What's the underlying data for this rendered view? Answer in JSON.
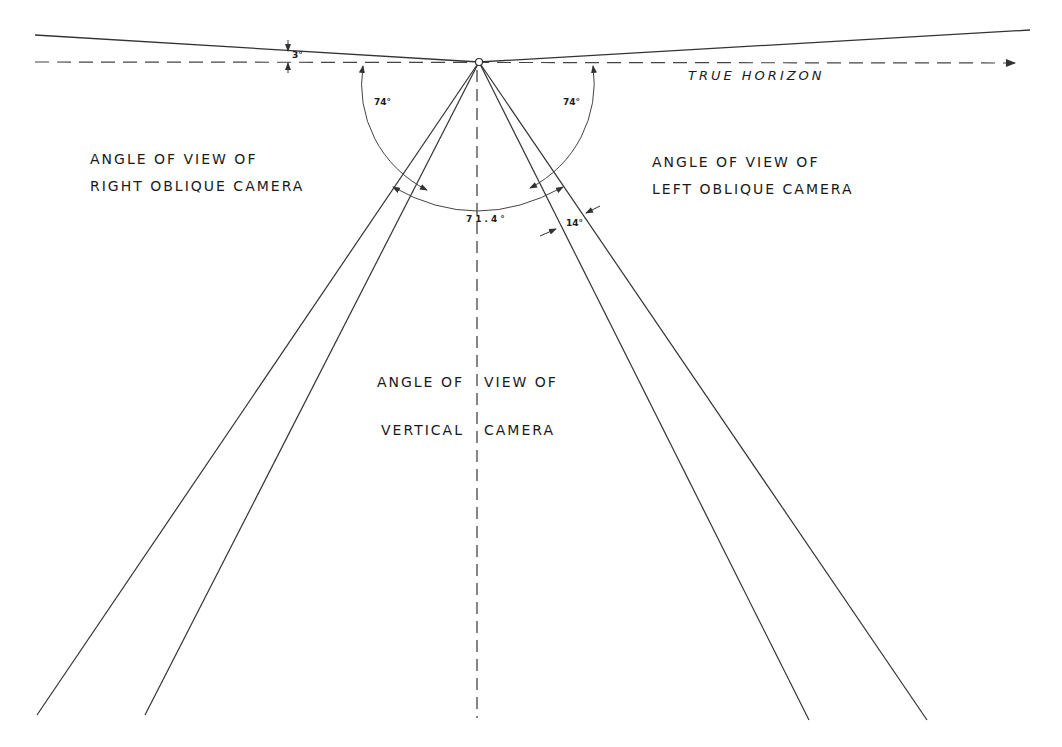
{
  "diagram": {
    "horizon_label": "TRUE HORIZON",
    "labels": {
      "right_oblique": [
        "ANGLE OF VIEW OF",
        "RIGHT OBLIQUE CAMERA"
      ],
      "left_oblique": [
        "ANGLE OF VIEW OF",
        "LEFT OBLIQUE CAMERA"
      ],
      "vertical": [
        "ANGLE OF",
        "VIEW OF",
        "VERTICAL",
        "CAMERA"
      ]
    },
    "angles": {
      "tilt": "3°",
      "right_oblique_depression": "74°",
      "left_oblique_depression": "74°",
      "vertical_field": "71.4°",
      "overlap": "14°"
    },
    "colors": {
      "line": "#333333",
      "text": "#1a1a1a",
      "background": "#ffffff"
    }
  }
}
